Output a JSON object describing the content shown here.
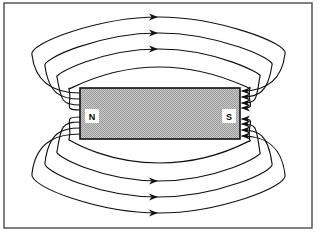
{
  "figure": {
    "frame": {
      "x": 4,
      "y": 3,
      "width": 308,
      "height": 225,
      "stroke_color": "#4a4a4a",
      "fill_color": "#ffffff",
      "stroke_width": 1.4
    },
    "background_color": "#ffffff",
    "line_color": "#111111"
  },
  "magnet": {
    "name": "bar-magnet",
    "x": 80,
    "y": 88,
    "width": 160,
    "height": 51,
    "fill_color": "#b6b6b6",
    "stroke_color": "#111111",
    "stroke_width": 1.6,
    "pattern": "halftone-checker",
    "north_pole": {
      "label": "N",
      "cx": 92,
      "cy": 116,
      "patch_fill": "#ffffff"
    },
    "south_pole": {
      "label": "S",
      "cx": 229,
      "cy": 116,
      "patch_fill": "#ffffff"
    }
  },
  "field_lines": {
    "description": "Closed magnetic field loops running from the north pole, around the magnet, into the south pole.",
    "count_above": 4,
    "count_below": 4,
    "direction": "north-to-south",
    "upper_loops": [
      {
        "id": "upper-1",
        "exit_y": 93,
        "apex_y": 17,
        "entry_y": 91,
        "left_x": 32,
        "right_x": 285,
        "arrow": true,
        "arrow_x": 158
      },
      {
        "id": "upper-2",
        "exit_y": 99,
        "apex_y": 33,
        "entry_y": 97,
        "left_x": 45,
        "right_x": 272,
        "arrow": true,
        "arrow_x": 158
      },
      {
        "id": "upper-3",
        "exit_y": 105,
        "apex_y": 49,
        "entry_y": 103,
        "left_x": 57,
        "right_x": 260,
        "arrow": true,
        "arrow_x": 158
      },
      {
        "id": "upper-4",
        "exit_y": 110,
        "apex_y": 67,
        "entry_y": 108,
        "left_x": 69,
        "right_x": 250,
        "arrow": false,
        "arrow_x": 158
      }
    ],
    "lower_loops": [
      {
        "id": "lower-1",
        "exit_y": 134,
        "apex_y": 213,
        "entry_y": 136,
        "left_x": 32,
        "right_x": 285,
        "arrow": true,
        "arrow_x": 158
      },
      {
        "id": "lower-2",
        "exit_y": 128,
        "apex_y": 197,
        "entry_y": 130,
        "left_x": 45,
        "right_x": 272,
        "arrow": true,
        "arrow_x": 158
      },
      {
        "id": "lower-3",
        "exit_y": 122,
        "apex_y": 181,
        "entry_y": 124,
        "left_x": 57,
        "right_x": 260,
        "arrow": true,
        "arrow_x": 158
      },
      {
        "id": "lower-4",
        "exit_y": 117,
        "apex_y": 163,
        "entry_y": 119,
        "left_x": 69,
        "right_x": 250,
        "arrow": false,
        "arrow_x": 158
      }
    ],
    "top_arrow_count": 3,
    "bottom_arrow_count": 3,
    "south_pole_arrow_count": 8,
    "south_pole_arrows_y": [
      91,
      97,
      103,
      108,
      119,
      124,
      130,
      136
    ],
    "arrow_color": "#111111",
    "arrow_length": 9,
    "arrow_half_width": 3.6
  }
}
